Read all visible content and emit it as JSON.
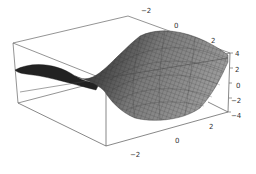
{
  "chart_data": {
    "type": "surface3d",
    "title": "",
    "function_hint": "saddle surface z = x^2 - y^2 (approximately)",
    "x_ticks": [
      "-2",
      "0",
      "2"
    ],
    "y_ticks": [
      "-2",
      "0",
      "2"
    ],
    "z_ticks": [
      "4",
      "2",
      "0",
      "-2",
      "-4"
    ],
    "x_range": [
      -3,
      3
    ],
    "y_range": [
      -3,
      3
    ],
    "z_range": [
      -4,
      4
    ],
    "box": true,
    "mesh": true,
    "shading": "grayscale",
    "xlabel": "",
    "ylabel": "",
    "zlabel": ""
  },
  "labels": {
    "top_axis": [
      {
        "text": "-2",
        "x": 141,
        "y": 7
      },
      {
        "text": "0",
        "x": 174,
        "y": 22
      },
      {
        "text": "2",
        "x": 211,
        "y": 37
      }
    ],
    "right_axis": [
      {
        "text": "4",
        "x": 235,
        "y": 50
      },
      {
        "text": "2",
        "x": 235,
        "y": 66
      },
      {
        "text": "0",
        "x": 236,
        "y": 82
      },
      {
        "text": "-2",
        "x": 231,
        "y": 97
      },
      {
        "text": "-4",
        "x": 231,
        "y": 112
      }
    ],
    "bottom_axis": [
      {
        "text": "2",
        "x": 209,
        "y": 123
      },
      {
        "text": "0",
        "x": 175,
        "y": 137
      },
      {
        "text": "-2",
        "x": 130,
        "y": 151
      }
    ]
  }
}
